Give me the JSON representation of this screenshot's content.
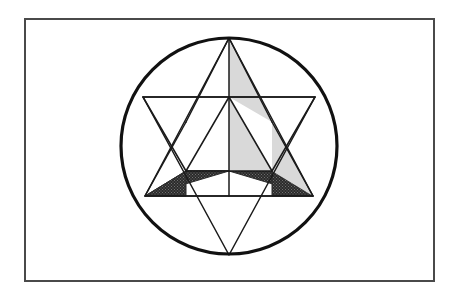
{
  "figure": {
    "canvas": {
      "width": 459,
      "height": 296,
      "background": "#ffffff"
    },
    "colors": {
      "ink": "#1a1a1a",
      "frame_stroke": "#4a4a4a",
      "circle_stroke": "#111111",
      "line_stroke": "#1a1a1a",
      "shade_light": "#d9d9d9",
      "shade_dark": "#2b2b2b",
      "background": "#ffffff"
    },
    "frame": {
      "label": "outer-frame",
      "x": 25,
      "y": 19,
      "width": 409,
      "height": 262,
      "stroke_width": 2
    },
    "circle": {
      "label": "circumscribing-circle",
      "cx": 229,
      "cy": 146,
      "r": 108,
      "stroke_width": 3.2
    },
    "vertices": {
      "top": {
        "x": 229,
        "y": 38
      },
      "upper_right": {
        "x": 315,
        "y": 97
      },
      "lower_right": {
        "x": 313,
        "y": 196
      },
      "bottom": {
        "x": 229,
        "y": 255
      },
      "lower_left": {
        "x": 145,
        "y": 196
      },
      "upper_left": {
        "x": 143,
        "y": 97
      },
      "center": {
        "x": 229,
        "y": 146
      }
    },
    "hexagon_inner": {
      "label": "inner-hexagon",
      "points": [
        {
          "x": 229,
          "y": 97
        },
        {
          "x": 272,
          "y": 122
        },
        {
          "x": 272,
          "y": 171
        },
        {
          "x": 229,
          "y": 196
        },
        {
          "x": 186,
          "y": 171
        },
        {
          "x": 186,
          "y": 122
        }
      ]
    },
    "triangles": {
      "upward": {
        "label": "upward-triangle",
        "points": "229,38 313,196 145,196",
        "fill": "none",
        "stroke_width": 1.5
      },
      "downward": {
        "label": "downward-triangle",
        "points": "143,97 315,97 229,255",
        "fill": "none",
        "stroke_width": 1.5
      }
    },
    "shaded_regions": [
      {
        "id": "shade-apex-right",
        "shade": "light",
        "points": "229,38 272,122 229,97",
        "note": "light gray wedge right of vertical axis below top apex"
      },
      {
        "id": "shade-center-right",
        "shade": "light",
        "points": "229,97 272,171 229,171",
        "note": "light gray wedge in central hexagon right of vertical axis"
      },
      {
        "id": "shade-right-point",
        "shade": "light",
        "points": "272,171 313,196 272,122",
        "note": "light gray wedge at right star point"
      },
      {
        "id": "shade-center-dark",
        "shade": "dark",
        "points": "229,171 272,171 186,171",
        "note": "dark stippled band across mid hexagon"
      },
      {
        "id": "shade-dark-left",
        "shade": "dark",
        "points": "229,171 186,171 145,196",
        "note": "dark stippled left wing of lower chevron"
      },
      {
        "id": "shade-dark-left-lower",
        "shade": "dark",
        "points": "186,171 145,196 186,196",
        "note": "dark stippled lower-left triangle"
      },
      {
        "id": "shade-dark-right",
        "shade": "dark",
        "points": "229,171 272,171 313,196",
        "note": "dark stippled right wing of lower chevron"
      },
      {
        "id": "shade-dark-right-lower",
        "shade": "dark",
        "points": "272,171 313,196 272,196",
        "note": "dark stippled lower-right triangle"
      }
    ],
    "construction_lines": [
      {
        "id": "line-horizontal-chord",
        "x1": 143,
        "y1": 97,
        "x2": 315,
        "y2": 97,
        "note": "top edge of downward triangle"
      },
      {
        "id": "line-horizontal-lower",
        "x1": 145,
        "y1": 196,
        "x2": 313,
        "y2": 196,
        "note": "base of upward triangle"
      },
      {
        "id": "line-vertical-axis",
        "x1": 229,
        "y1": 38,
        "x2": 229,
        "y2": 196,
        "note": "median from top apex to base"
      },
      {
        "id": "line-apex-left-median",
        "x1": 229,
        "y1": 38,
        "x2": 186,
        "y2": 122,
        "note": "median toward left hexagon vertex"
      },
      {
        "id": "line-apex-right-median",
        "x1": 229,
        "y1": 38,
        "x2": 272,
        "y2": 122,
        "note": "median toward right hexagon vertex"
      },
      {
        "id": "line-hexagon-top-left",
        "x1": 229,
        "y1": 97,
        "x2": 186,
        "y2": 171,
        "note": "inner diagonal"
      },
      {
        "id": "line-hexagon-top-right",
        "x1": 229,
        "y1": 97,
        "x2": 272,
        "y2": 171,
        "note": "inner diagonal"
      },
      {
        "id": "line-mid-horizontal",
        "x1": 186,
        "y1": 171,
        "x2": 272,
        "y2": 171,
        "note": "inner hexagon lower chord"
      },
      {
        "id": "line-left-point-upper",
        "x1": 143,
        "y1": 97,
        "x2": 186,
        "y2": 171,
        "note": "left star point edge"
      },
      {
        "id": "line-left-point-lower",
        "x1": 145,
        "y1": 196,
        "x2": 186,
        "y2": 122,
        "note": "left star point edge"
      },
      {
        "id": "line-right-point-upper",
        "x1": 315,
        "y1": 97,
        "x2": 272,
        "y2": 171,
        "note": "right star point edge"
      },
      {
        "id": "line-right-point-lower",
        "x1": 313,
        "y1": 196,
        "x2": 272,
        "y2": 122,
        "note": "right star point edge"
      }
    ]
  }
}
